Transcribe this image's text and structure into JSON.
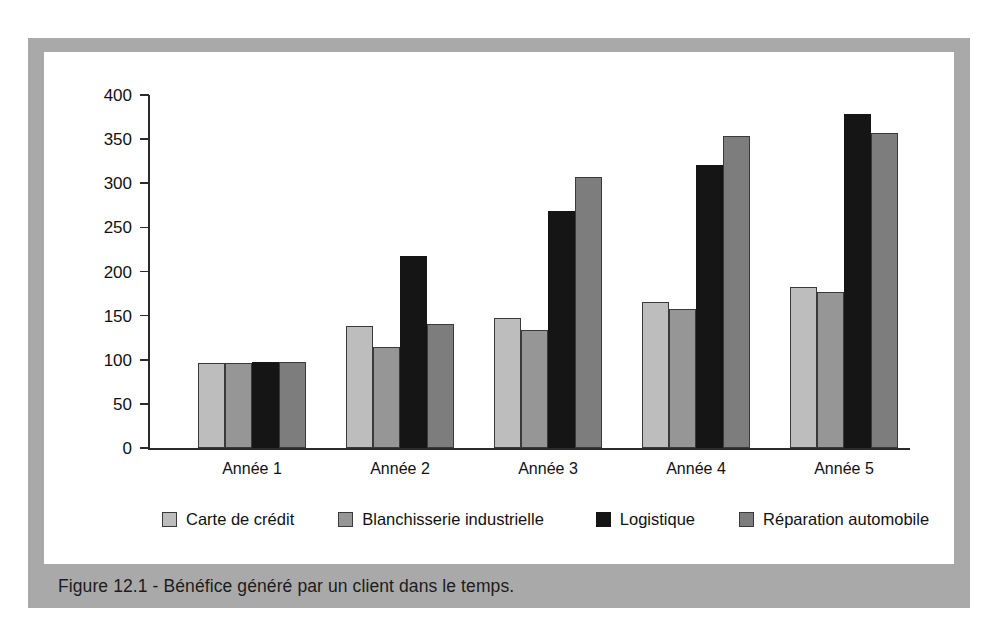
{
  "figure": {
    "caption": "Figure 12.1 - Bénéfice généré par un client dans le temps.",
    "frame_color": "#a9a9a9",
    "plate_color": "#ffffff"
  },
  "chart_data": {
    "type": "bar",
    "title": "",
    "xlabel": "",
    "ylabel": "",
    "ylim": [
      0,
      400
    ],
    "yticks": [
      0,
      50,
      100,
      150,
      200,
      250,
      300,
      350,
      400
    ],
    "grid": false,
    "legend_position": "bottom",
    "categories": [
      "Année 1",
      "Année 2",
      "Année 3",
      "Année 4",
      "Année 5"
    ],
    "series": [
      {
        "name": "Carte de crédit",
        "color": "#bdbdbd",
        "values": [
          96,
          138,
          147,
          165,
          182
        ]
      },
      {
        "name": "Blanchisserie industrielle",
        "color": "#969696",
        "values": [
          96,
          114,
          134,
          157,
          177
        ]
      },
      {
        "name": "Logistique",
        "color": "#151515",
        "values": [
          97,
          218,
          269,
          321,
          378
        ]
      },
      {
        "name": "Réparation automobile",
        "color": "#7d7d7d",
        "values": [
          97,
          140,
          307,
          353,
          357
        ]
      }
    ]
  }
}
